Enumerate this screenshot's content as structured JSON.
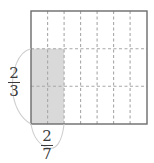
{
  "figure": {
    "type": "area-model",
    "background_color": "#ffffff",
    "rectangle": {
      "name": "unit-rectangle",
      "x": 31,
      "y": 11,
      "width": 116,
      "height": 113,
      "border_color": "#6b6b6b",
      "border_width": 1.4,
      "fill_color": "#ffffff"
    },
    "grid": {
      "columns": 7,
      "rows": 3,
      "line_color": "#a8a8a8",
      "line_style": "dashed",
      "dash_pattern": "3,2.5",
      "line_width": 1.1,
      "vertical_line_x": [
        47.6,
        64.1,
        80.6,
        97.1,
        113.6,
        130.1
      ],
      "horizontal_line_y": [
        48.7,
        86.3
      ]
    },
    "shaded_region": {
      "name": "shaded-product-region",
      "columns_shaded": 2,
      "rows_shaded": 2,
      "x": 31,
      "y": 48.7,
      "width": 33.1,
      "height": 75.3,
      "fill_color": "#d9d9d9",
      "opacity": 1
    },
    "height_brace": {
      "name": "height-brace",
      "orientation": "vertical",
      "style": "arc",
      "color": "#cfcfcf",
      "from_y": 48.7,
      "to_y": 124,
      "apex_x": 14
    },
    "width_brace": {
      "name": "width-brace",
      "orientation": "horizontal",
      "style": "arc",
      "color": "#cfcfcf",
      "from_x": 31,
      "to_x": 64.1,
      "apex_y": 148
    }
  },
  "labels": {
    "height_fraction": {
      "name": "height-fraction",
      "numerator": "2",
      "denominator": "3",
      "text": "2/3",
      "meaning": "vertical side length"
    },
    "width_fraction": {
      "name": "width-fraction",
      "numerator": "2",
      "denominator": "7",
      "text": "2/7",
      "meaning": "horizontal side length"
    }
  },
  "colors": {
    "ink": "#3a3a3a",
    "rect_border": "#6b6b6b",
    "grid": "#a8a8a8",
    "shade": "#d9d9d9",
    "brace": "#cfcfcf"
  }
}
